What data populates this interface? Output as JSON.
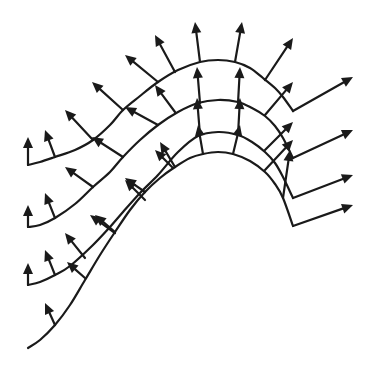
{
  "diagram": {
    "title": "",
    "stroke_color": "#1a1a1a",
    "background": "#ffffff",
    "curves": [
      {
        "name": "curve-1",
        "points": [
          [
            28,
            165
          ],
          [
            40,
            162
          ],
          [
            55,
            157
          ],
          [
            75,
            150
          ],
          [
            93,
            140
          ],
          [
            110,
            125
          ],
          [
            123,
            110
          ],
          [
            140,
            96
          ],
          [
            158,
            82
          ],
          [
            178,
            70
          ],
          [
            200,
            62
          ],
          [
            218,
            60
          ],
          [
            235,
            62
          ],
          [
            250,
            68
          ],
          [
            263,
            78
          ],
          [
            275,
            88
          ],
          [
            283,
            97
          ],
          [
            293,
            111
          ]
        ],
        "exit_arrow": [
          [
            293,
            111
          ],
          [
            353,
            77
          ]
        ]
      },
      {
        "name": "curve-2",
        "points": [
          [
            28,
            227
          ],
          [
            40,
            225
          ],
          [
            55,
            218
          ],
          [
            75,
            204
          ],
          [
            93,
            187
          ],
          [
            110,
            172
          ],
          [
            123,
            157
          ],
          [
            140,
            140
          ],
          [
            158,
            125
          ],
          [
            178,
            112
          ],
          [
            198,
            103
          ],
          [
            218,
            100
          ],
          [
            238,
            102
          ],
          [
            252,
            108
          ],
          [
            265,
            116
          ],
          [
            275,
            126
          ],
          [
            283,
            138
          ],
          [
            293,
            158
          ]
        ],
        "exit_arrow": [
          [
            293,
            158
          ],
          [
            353,
            130
          ]
        ]
      },
      {
        "name": "curve-3",
        "points": [
          [
            28,
            285
          ],
          [
            40,
            282
          ],
          [
            55,
            275
          ],
          [
            70,
            266
          ],
          [
            93,
            245
          ],
          [
            110,
            227
          ],
          [
            123,
            212
          ],
          [
            140,
            193
          ],
          [
            158,
            175
          ],
          [
            178,
            152
          ],
          [
            198,
            136
          ],
          [
            218,
            132
          ],
          [
            238,
            135
          ],
          [
            252,
            142
          ],
          [
            265,
            152
          ],
          [
            275,
            163
          ],
          [
            283,
            177
          ],
          [
            293,
            198
          ]
        ],
        "exit_arrow": [
          [
            293,
            198
          ],
          [
            353,
            175
          ]
        ]
      },
      {
        "name": "curve-4",
        "points": [
          [
            28,
            348
          ],
          [
            40,
            340
          ],
          [
            55,
            325
          ],
          [
            70,
            305
          ],
          [
            85,
            280
          ],
          [
            100,
            255
          ],
          [
            115,
            232
          ],
          [
            130,
            210
          ],
          [
            145,
            192
          ],
          [
            160,
            178
          ],
          [
            175,
            167
          ],
          [
            190,
            158
          ],
          [
            203,
            154
          ],
          [
            218,
            152
          ],
          [
            233,
            154
          ],
          [
            250,
            161
          ],
          [
            265,
            172
          ],
          [
            275,
            184
          ],
          [
            283,
            198
          ],
          [
            293,
            226
          ]
        ],
        "exit_arrow": [
          [
            293,
            226
          ],
          [
            353,
            205
          ]
        ]
      }
    ],
    "normals": [
      [
        [
          28,
          165
        ],
        [
          28,
          137
        ]
      ],
      [
        [
          55,
          157
        ],
        [
          45,
          130
        ]
      ],
      [
        [
          93,
          140
        ],
        [
          65,
          110
        ]
      ],
      [
        [
          123,
          110
        ],
        [
          92,
          82
        ]
      ],
      [
        [
          158,
          82
        ],
        [
          125,
          55
        ]
      ],
      [
        [
          175,
          72
        ],
        [
          155,
          35
        ]
      ],
      [
        [
          200,
          62
        ],
        [
          195,
          22
        ]
      ],
      [
        [
          235,
          62
        ],
        [
          242,
          22
        ]
      ],
      [
        [
          265,
          80
        ],
        [
          293,
          38
        ]
      ],
      [
        [
          28,
          227
        ],
        [
          28,
          205
        ]
      ],
      [
        [
          55,
          218
        ],
        [
          45,
          193
        ]
      ],
      [
        [
          93,
          187
        ],
        [
          65,
          167
        ]
      ],
      [
        [
          123,
          157
        ],
        [
          92,
          137
        ]
      ],
      [
        [
          158,
          125
        ],
        [
          125,
          107
        ]
      ],
      [
        [
          175,
          112
        ],
        [
          155,
          85
        ]
      ],
      [
        [
          200,
          103
        ],
        [
          197,
          67
        ]
      ],
      [
        [
          238,
          103
        ],
        [
          240,
          67
        ]
      ],
      [
        [
          265,
          115
        ],
        [
          293,
          82
        ]
      ],
      [
        [
          28,
          285
        ],
        [
          28,
          263
        ]
      ],
      [
        [
          55,
          275
        ],
        [
          45,
          250
        ]
      ],
      [
        [
          85,
          258
        ],
        [
          65,
          233
        ]
      ],
      [
        [
          115,
          233
        ],
        [
          90,
          215
        ]
      ],
      [
        [
          145,
          200
        ],
        [
          125,
          180
        ]
      ],
      [
        [
          173,
          168
        ],
        [
          155,
          150
        ]
      ],
      [
        [
          200,
          135
        ],
        [
          197,
          98
        ]
      ],
      [
        [
          238,
          135
        ],
        [
          240,
          98
        ]
      ],
      [
        [
          265,
          150
        ],
        [
          293,
          122
        ]
      ],
      [
        [
          55,
          325
        ],
        [
          45,
          303
        ]
      ],
      [
        [
          85,
          278
        ],
        [
          67,
          262
        ]
      ],
      [
        [
          115,
          232
        ],
        [
          95,
          215
        ]
      ],
      [
        [
          145,
          192
        ],
        [
          125,
          178
        ]
      ],
      [
        [
          175,
          167
        ],
        [
          160,
          142
        ]
      ],
      [
        [
          203,
          154
        ],
        [
          198,
          125
        ]
      ],
      [
        [
          233,
          154
        ],
        [
          240,
          125
        ]
      ],
      [
        [
          265,
          170
        ],
        [
          293,
          140
        ]
      ],
      [
        [
          283,
          198
        ],
        [
          290,
          150
        ]
      ]
    ]
  }
}
